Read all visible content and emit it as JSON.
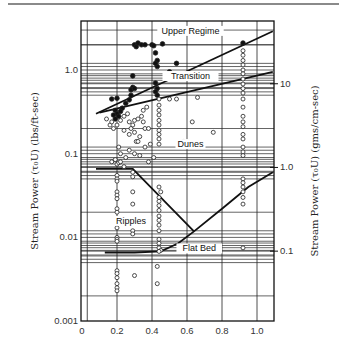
{
  "chart_data": {
    "type": "scatter",
    "title": "",
    "xlabel": "",
    "ylabel": "Stream Power (τ₀U) (lbs/ft-sec)",
    "ylabel_right": "Stream Power (τ₀U) (gms/cm-sec)",
    "x_ticks": [
      "0",
      "0.2",
      "0.4",
      "0.6",
      "0.8",
      "1.0"
    ],
    "x_tick_values": [
      0,
      0.2,
      0.4,
      0.6,
      0.8,
      1.0
    ],
    "xlim": [
      0,
      1.1
    ],
    "y_scale": "log",
    "y_ticks": [
      "0.001",
      "0.01",
      "0.1",
      "1.0"
    ],
    "y_tick_values": [
      0.001,
      0.01,
      0.1,
      1.0
    ],
    "ylim": [
      0.001,
      3.85
    ],
    "y_right_ticks": [
      "0.1",
      "1.0",
      "10"
    ],
    "y_right_tick_values_in_left_units": [
      0.00685,
      0.0685,
      0.685
    ],
    "grid": true,
    "legend": "none",
    "region_labels": [
      {
        "text": "Upper Regime",
        "x": 0.62,
        "y": 2.7
      },
      {
        "text": "Transition",
        "x": 0.62,
        "y": 0.78
      },
      {
        "text": "Dunes",
        "x": 0.62,
        "y": 0.12
      },
      {
        "text": "Ripples",
        "x": 0.28,
        "y": 0.0145
      },
      {
        "text": "Flat Bed",
        "x": 0.67,
        "y": 0.0068
      }
    ],
    "boundary_lines": [
      {
        "name": "Upper Regime boundary",
        "points": [
          [
            0.08,
            0.3
          ],
          [
            1.09,
            2.9
          ]
        ]
      },
      {
        "name": "Transition boundary",
        "points": [
          [
            0.1,
            0.31
          ],
          [
            1.09,
            0.95
          ]
        ]
      },
      {
        "name": "Ripple-Dune boundary",
        "points": [
          [
            0.08,
            0.066
          ],
          [
            0.29,
            0.066
          ],
          [
            0.64,
            0.0118
          ]
        ]
      },
      {
        "name": "Flat Bed boundary",
        "points": [
          [
            0.13,
            0.0066
          ],
          [
            0.3,
            0.0066
          ],
          [
            0.45,
            0.0068
          ],
          [
            0.55,
            0.0085
          ],
          [
            0.64,
            0.0118
          ],
          [
            0.8,
            0.022
          ],
          [
            0.95,
            0.04
          ],
          [
            1.09,
            0.06
          ]
        ]
      }
    ],
    "series": [
      {
        "name": "Upper regime (filled)",
        "marker": "filled-circle",
        "points": [
          [
            0.3,
            2.0
          ],
          [
            0.31,
            1.9
          ],
          [
            0.32,
            2.1
          ],
          [
            0.34,
            2.0
          ],
          [
            0.36,
            2.0
          ],
          [
            0.4,
            2.0
          ],
          [
            0.41,
            1.95
          ],
          [
            0.46,
            2.05
          ],
          [
            0.42,
            1.6
          ],
          [
            0.43,
            1.3
          ],
          [
            0.43,
            1.1
          ],
          [
            0.42,
            1.2
          ],
          [
            0.54,
            1.2
          ],
          [
            0.5,
            0.95
          ],
          [
            0.29,
            0.85
          ],
          [
            0.29,
            0.62
          ],
          [
            0.28,
            0.58
          ],
          [
            0.3,
            0.6
          ],
          [
            0.28,
            0.5
          ],
          [
            0.17,
            0.45
          ],
          [
            0.2,
            0.46
          ],
          [
            0.25,
            0.4
          ],
          [
            0.27,
            0.44
          ],
          [
            0.23,
            0.35
          ],
          [
            0.22,
            0.32
          ],
          [
            0.19,
            0.33
          ],
          [
            0.2,
            0.3
          ],
          [
            0.21,
            0.28
          ],
          [
            0.18,
            0.29
          ],
          [
            0.19,
            0.26
          ],
          [
            0.42,
            0.7
          ],
          [
            0.43,
            0.6
          ],
          [
            0.42,
            0.55
          ],
          [
            0.43,
            0.5
          ],
          [
            0.92,
            2.1
          ]
        ]
      },
      {
        "name": "Lower regime (open)",
        "marker": "open-circle",
        "points": [
          [
            0.92,
            1.7
          ],
          [
            0.92,
            1.5
          ],
          [
            0.92,
            1.3
          ],
          [
            0.92,
            1.15
          ],
          [
            0.92,
            1.0
          ],
          [
            0.92,
            0.9
          ],
          [
            0.92,
            0.78
          ],
          [
            0.92,
            0.68
          ],
          [
            0.92,
            0.6
          ],
          [
            0.92,
            0.53
          ],
          [
            0.92,
            0.45
          ],
          [
            0.92,
            0.36
          ],
          [
            0.92,
            0.28
          ],
          [
            0.92,
            0.24
          ],
          [
            0.92,
            0.21
          ],
          [
            0.92,
            0.17
          ],
          [
            0.92,
            0.15
          ],
          [
            0.92,
            0.12
          ],
          [
            0.92,
            0.105
          ],
          [
            0.92,
            0.095
          ],
          [
            0.92,
            0.05
          ],
          [
            0.92,
            0.045
          ],
          [
            0.92,
            0.04
          ],
          [
            0.92,
            0.035
          ],
          [
            0.92,
            0.03
          ],
          [
            0.92,
            0.025
          ],
          [
            0.92,
            0.0075
          ],
          [
            0.5,
            0.45
          ],
          [
            0.54,
            0.45
          ],
          [
            0.63,
            0.24
          ],
          [
            0.66,
            0.47
          ],
          [
            0.75,
            0.18
          ],
          [
            0.58,
            0.14
          ],
          [
            0.14,
            0.26
          ],
          [
            0.16,
            0.22
          ],
          [
            0.17,
            0.24
          ],
          [
            0.18,
            0.2
          ],
          [
            0.2,
            0.22
          ],
          [
            0.22,
            0.25
          ],
          [
            0.24,
            0.28
          ],
          [
            0.26,
            0.3
          ],
          [
            0.27,
            0.24
          ],
          [
            0.29,
            0.22
          ],
          [
            0.3,
            0.25
          ],
          [
            0.32,
            0.26
          ],
          [
            0.34,
            0.28
          ],
          [
            0.35,
            0.33
          ],
          [
            0.37,
            0.36
          ],
          [
            0.24,
            0.19
          ],
          [
            0.27,
            0.17
          ],
          [
            0.28,
            0.2
          ],
          [
            0.3,
            0.18
          ],
          [
            0.31,
            0.14
          ],
          [
            0.33,
            0.16
          ],
          [
            0.36,
            0.2
          ],
          [
            0.38,
            0.2
          ],
          [
            0.35,
            0.24
          ],
          [
            0.21,
            0.12
          ],
          [
            0.22,
            0.1
          ],
          [
            0.25,
            0.09
          ],
          [
            0.27,
            0.11
          ],
          [
            0.3,
            0.1
          ],
          [
            0.33,
            0.095
          ],
          [
            0.36,
            0.12
          ],
          [
            0.38,
            0.08
          ],
          [
            0.39,
            0.13
          ],
          [
            0.41,
            0.09
          ],
          [
            0.32,
            0.14
          ],
          [
            0.17,
            0.08
          ],
          [
            0.19,
            0.085
          ],
          [
            0.2,
            0.075
          ],
          [
            0.21,
            0.078
          ],
          [
            0.22,
            0.08
          ],
          [
            0.24,
            0.07
          ],
          [
            0.44,
            0.45
          ],
          [
            0.44,
            0.38
          ],
          [
            0.44,
            0.33
          ],
          [
            0.44,
            0.29
          ],
          [
            0.44,
            0.25
          ],
          [
            0.44,
            0.22
          ],
          [
            0.44,
            0.19
          ],
          [
            0.44,
            0.17
          ],
          [
            0.44,
            0.15
          ],
          [
            0.44,
            0.13
          ],
          [
            0.2,
            0.055
          ],
          [
            0.2,
            0.05
          ],
          [
            0.2,
            0.047
          ],
          [
            0.2,
            0.035
          ],
          [
            0.2,
            0.032
          ],
          [
            0.2,
            0.029
          ],
          [
            0.2,
            0.022
          ],
          [
            0.2,
            0.02
          ],
          [
            0.2,
            0.017
          ],
          [
            0.2,
            0.015
          ],
          [
            0.2,
            0.013
          ],
          [
            0.2,
            0.01
          ],
          [
            0.2,
            0.0095
          ],
          [
            0.2,
            0.009
          ],
          [
            0.2,
            0.004
          ],
          [
            0.2,
            0.0037
          ],
          [
            0.2,
            0.0033
          ],
          [
            0.2,
            0.0028
          ],
          [
            0.2,
            0.0025
          ],
          [
            0.2,
            0.0023
          ],
          [
            0.29,
            0.06
          ],
          [
            0.29,
            0.053
          ],
          [
            0.29,
            0.035
          ],
          [
            0.29,
            0.025
          ],
          [
            0.29,
            0.012
          ],
          [
            0.29,
            0.011
          ],
          [
            0.3,
            0.0035
          ],
          [
            0.44,
            0.04
          ],
          [
            0.45,
            0.035
          ],
          [
            0.44,
            0.03
          ],
          [
            0.44,
            0.027
          ],
          [
            0.44,
            0.024
          ],
          [
            0.44,
            0.021
          ],
          [
            0.44,
            0.018
          ],
          [
            0.44,
            0.016
          ],
          [
            0.44,
            0.014
          ],
          [
            0.44,
            0.012
          ],
          [
            0.44,
            0.0095
          ],
          [
            0.44,
            0.0085
          ],
          [
            0.44,
            0.0075
          ],
          [
            0.45,
            0.007
          ],
          [
            0.44,
            0.0068
          ],
          [
            0.43,
            0.0045
          ],
          [
            0.43,
            0.0028
          ]
        ]
      }
    ]
  }
}
